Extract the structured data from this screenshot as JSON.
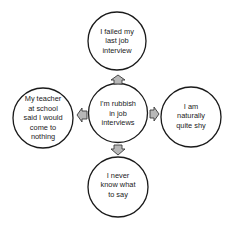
{
  "diagram": {
    "type": "mind-map",
    "colors": {
      "background": "#ffffff",
      "circle_fill": "#ffffff",
      "circle_stroke": "#1a1a1a",
      "arrow_fill": "#b8b8b8",
      "arrow_stroke": "#3a3a3a",
      "text": "#1a1a1a"
    },
    "center": {
      "text": "I'm rubbish\nin job\ninterviews"
    },
    "nodes": {
      "top": {
        "text": "I failed my\nlast job\ninterview"
      },
      "left": {
        "text": "My teacher\nat school\nsaid I would\ncome to\nnothing"
      },
      "right": {
        "text": "I am\nnaturally\nquite shy"
      },
      "bottom": {
        "text": "I  never\nknow what\nto say"
      }
    },
    "arrows": [
      {
        "from": "center",
        "to": "top",
        "direction": "up"
      },
      {
        "from": "center",
        "to": "left",
        "direction": "left"
      },
      {
        "from": "center",
        "to": "right",
        "direction": "right"
      },
      {
        "from": "center",
        "to": "bottom",
        "direction": "down"
      }
    ]
  }
}
